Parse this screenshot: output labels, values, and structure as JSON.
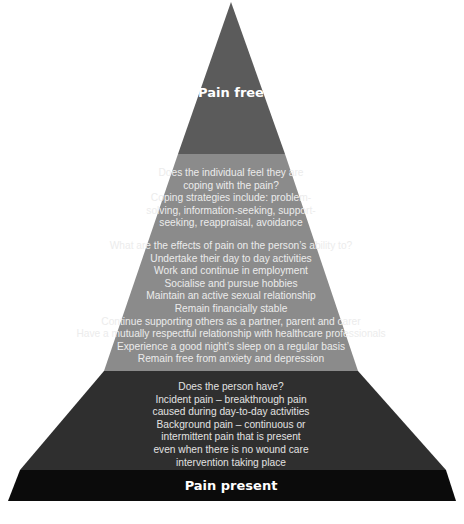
{
  "diagram": {
    "type": "pyramid",
    "top_label": "Pain free",
    "bottom_label": "Pain present",
    "tiers": [
      {
        "name": "top",
        "label": "Pain free",
        "color": "#5b5b5b",
        "lines": []
      },
      {
        "name": "coping-and-effects",
        "color": "#8b8b8b",
        "blocks": [
          {
            "lines": [
              "Does the individual feel they are",
              "coping with the pain?",
              "Coping strategies include: problem-",
              "solving, information-seeking, support-",
              "seeking, reappraisal, avoidance"
            ]
          },
          {
            "lines": [
              "What are the effects of pain on the person’s ability to?",
              "Undertake their day to day activities",
              "Work and continue in employment",
              "Socialise and pursue hobbies",
              "Maintain an active sexual relationship",
              "Remain financially stable",
              "Continue supporting others as a partner, parent and carer",
              "Have a mutually respectful relationship with healthcare professionals",
              "Experience a good night’s sleep on a regular basis",
              "Remain free from anxiety and depression"
            ]
          }
        ]
      },
      {
        "name": "pain-types",
        "color": "#2f2f2f",
        "lines": [
          "Does the person have?",
          "Incident pain – breakthrough pain",
          "caused during day-to-day activities",
          "Background pain – continuous or",
          "intermittent pain that is present",
          "even when there is no wound care",
          "intervention taking place"
        ]
      },
      {
        "name": "base",
        "label": "Pain present",
        "color": "#0b0b0b",
        "lines": []
      }
    ]
  }
}
